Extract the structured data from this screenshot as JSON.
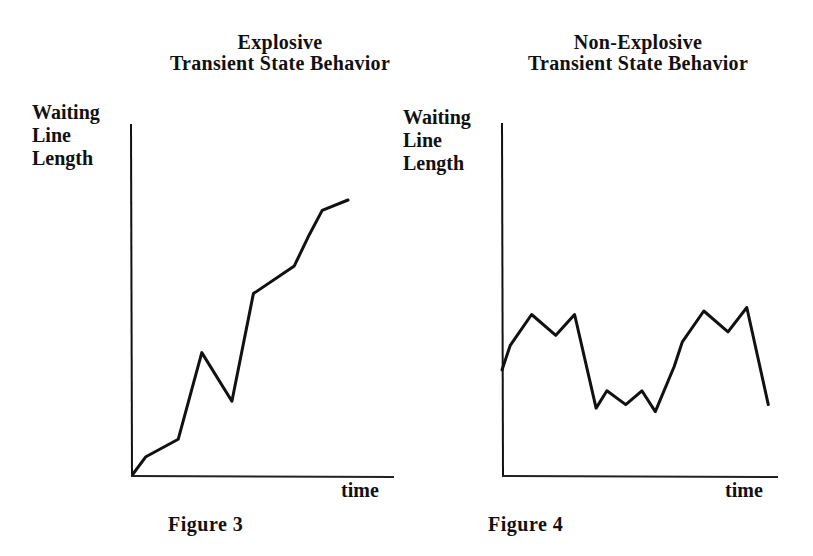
{
  "figures": [
    {
      "title_line1": "Explosive",
      "title_line2": "Transient State Behavior",
      "ylabel_lines": [
        "Waiting",
        "Line",
        "Length"
      ],
      "xlabel": "time",
      "caption": "Figure 3"
    },
    {
      "title_line1": "Non-Explosive",
      "title_line2": "Transient State Behavior",
      "ylabel_lines": [
        "Waiting",
        "Line",
        "Length"
      ],
      "xlabel": "time",
      "caption": "Figure 4"
    }
  ],
  "colors": {
    "ink": "#111111",
    "background": "#ffffff"
  },
  "chart_data": [
    {
      "type": "line",
      "title": "Explosive Transient State Behavior",
      "xlabel": "time",
      "ylabel": "Waiting Line Length",
      "caption": "Figure 3",
      "grid": false,
      "legend": null,
      "note": "Qualitative sketch; no tick marks. Values are relative (0-100) estimated from pixel positions.",
      "x": [
        0,
        6,
        21,
        32,
        46,
        56,
        75,
        82,
        88,
        100
      ],
      "values": [
        0,
        5,
        10,
        35,
        21,
        52,
        60,
        69,
        76,
        79
      ],
      "xlim": [
        0,
        100
      ],
      "ylim": [
        0,
        100
      ]
    },
    {
      "type": "line",
      "title": "Non-Explosive Transient State Behavior",
      "xlabel": "time",
      "ylabel": "Waiting Line Length",
      "caption": "Figure 4",
      "grid": false,
      "legend": null,
      "note": "Qualitative sketch; no tick marks. Values are relative (0-100) estimated from pixel positions.",
      "x": [
        0,
        3,
        11,
        20,
        27,
        35,
        39,
        46,
        52,
        57,
        64,
        67,
        75,
        84,
        91,
        99
      ],
      "values": [
        30,
        37,
        46,
        40,
        46,
        19,
        24,
        20,
        24,
        18,
        31,
        38,
        47,
        41,
        48,
        20
      ],
      "xlim": [
        0,
        100
      ],
      "ylim": [
        0,
        100
      ]
    }
  ]
}
